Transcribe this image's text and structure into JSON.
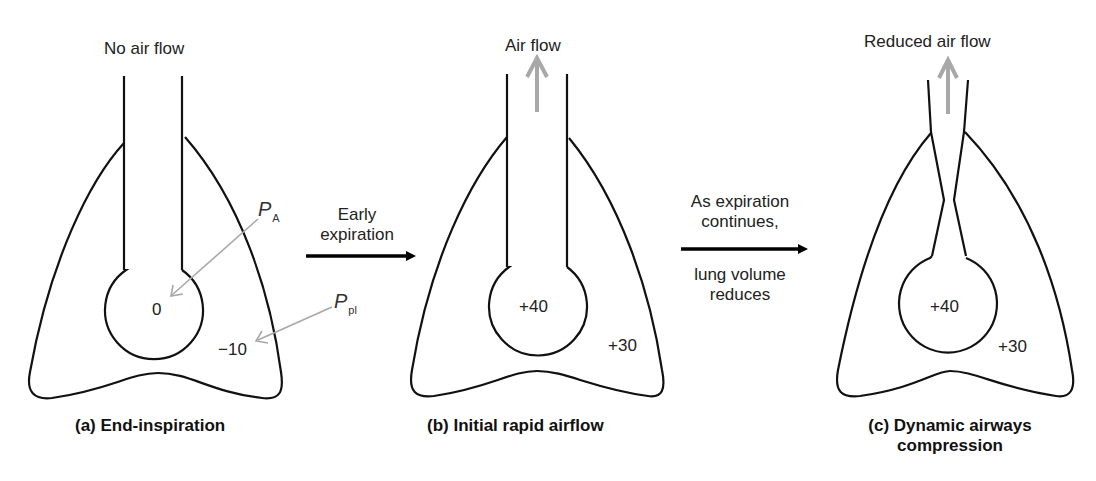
{
  "panels": [
    {
      "id": "a",
      "top_label": "No air flow",
      "caption": "(a) End-inspiration",
      "alveolar_pressure": "0",
      "pleural_pressure": "−10",
      "annotations": {
        "PA": {
          "main": "P",
          "sub": "A"
        },
        "Ppl": {
          "main": "P",
          "sub": "pl"
        }
      }
    },
    {
      "id": "b",
      "top_label": "Air flow",
      "caption": "(b) Initial rapid airflow",
      "alveolar_pressure": "+40",
      "pleural_pressure": "+30"
    },
    {
      "id": "c",
      "top_label": "Reduced air flow",
      "caption_line1": "(c) Dynamic airways",
      "caption_line2": "compression",
      "alveolar_pressure": "+40",
      "pleural_pressure": "+30"
    }
  ],
  "transitions": [
    {
      "line1": "Early",
      "line2": "expiration"
    },
    {
      "above1": "As expiration",
      "above2": "continues,",
      "below1": "lung volume",
      "below2": "reduces"
    }
  ],
  "colors": {
    "outline": "#111111",
    "annotation_arrow": "#a8a8a8",
    "flow_arrow": "#a8a8a8",
    "transition_arrow": "#000000"
  }
}
